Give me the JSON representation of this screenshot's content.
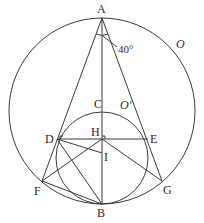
{
  "diagram": {
    "type": "geometry",
    "points": {
      "A": {
        "label": "A",
        "x": 102,
        "y": 18
      },
      "B": {
        "label": "B",
        "x": 102,
        "y": 204
      },
      "C": {
        "label": "C",
        "x": 102,
        "y": 111
      },
      "D": {
        "label": "D",
        "x": 57,
        "y": 139
      },
      "E": {
        "label": "E",
        "x": 148,
        "y": 139
      },
      "F": {
        "label": "F",
        "x": 42,
        "y": 181
      },
      "G": {
        "label": "G",
        "x": 162,
        "y": 181
      },
      "H": {
        "label": "H",
        "x": 102,
        "y": 139
      },
      "I": {
        "label": "I",
        "x": 102,
        "y": 153
      }
    },
    "circles": {
      "O": {
        "label": "O",
        "cx": 102,
        "cy": 111,
        "r": 93
      },
      "O_prime": {
        "label": "O′",
        "cx": 102,
        "cy": 158,
        "r": 46
      }
    },
    "angle": {
      "label": "40°",
      "vertex": "A"
    },
    "segments": [
      "AF",
      "AG",
      "AB",
      "DE",
      "DI",
      "DB",
      "FH",
      "FB",
      "HG"
    ],
    "right_angles": [
      "D",
      "H"
    ]
  }
}
